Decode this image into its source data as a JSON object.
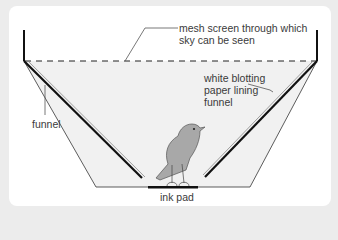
{
  "diagram": {
    "labels": {
      "mesh_line1": "mesh screen through which",
      "mesh_line2": "sky can be seen",
      "blot_line1": "white blotting",
      "blot_line2": "paper lining",
      "blot_line3": "funnel",
      "funnel": "funnel",
      "ink_pad": "ink pad"
    },
    "colors": {
      "panel_bg": "#ffffff",
      "outer_bg": "#ececec",
      "funnel_fill": "#f0f0f0",
      "bird_fill": "#a8a8a8",
      "line": "#222222",
      "text": "#3a3a3a"
    }
  }
}
